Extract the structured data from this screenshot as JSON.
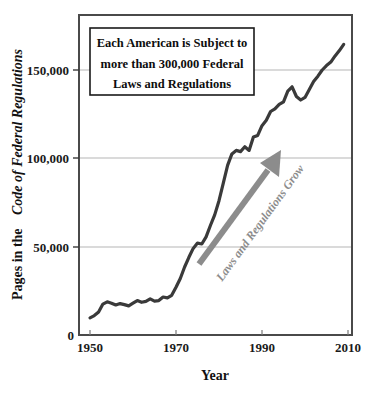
{
  "chart_data": {
    "type": "line",
    "title": "",
    "xlabel": "Year",
    "ylabel_plain": "Pages in the ",
    "ylabel_italic": "Code of Federal Regulations",
    "xlim": [
      1950,
      2013
    ],
    "ylim": [
      0,
      175000
    ],
    "grid": true,
    "legend_position": "none",
    "xticks": [
      "1950",
      "1970",
      "1990",
      "2010"
    ],
    "xtick_values": [
      1950,
      1970,
      1990,
      2010
    ],
    "yticks": [
      "0",
      "50,000",
      "100,000",
      "150,000"
    ],
    "ytick_values": [
      0,
      50000,
      100000,
      150000
    ],
    "series": [
      {
        "name": "Pages in the Code of Federal Regulations",
        "color": "#3a3a3a",
        "x": [
          1950,
          1951,
          1952,
          1953,
          1954,
          1955,
          1956,
          1957,
          1958,
          1959,
          1960,
          1961,
          1962,
          1963,
          1964,
          1965,
          1966,
          1967,
          1968,
          1969,
          1970,
          1971,
          1972,
          1973,
          1974,
          1975,
          1976,
          1977,
          1978,
          1979,
          1980,
          1981,
          1982,
          1983,
          1984,
          1985,
          1986,
          1987,
          1988,
          1989,
          1990,
          1991,
          1992,
          1993,
          1994,
          1995,
          1996,
          1997,
          1998,
          1999,
          2000,
          2001,
          2002,
          2003,
          2004,
          2005,
          2006,
          2007,
          2008,
          2009
        ],
        "values": [
          9745,
          11000,
          13000,
          17500,
          18800,
          18000,
          17000,
          17800,
          17200,
          16500,
          18000,
          19500,
          18500,
          19000,
          20500,
          19200,
          19500,
          21500,
          21000,
          22500,
          27000,
          32000,
          38500,
          44000,
          49000,
          52000,
          51500,
          55500,
          62000,
          68000,
          76000,
          86000,
          96000,
          102500,
          104500,
          103800,
          106500,
          104500,
          112000,
          113000,
          118500,
          121500,
          126500,
          128000,
          130500,
          132000,
          138000,
          140500,
          135000,
          133000,
          134500,
          139000,
          143500,
          146500,
          150000,
          152500,
          154500,
          158000,
          161000,
          164500
        ]
      }
    ],
    "callout": {
      "lines": [
        "Each American is Subject to",
        "more than 300,000 Federal",
        "Laws and Regulations"
      ]
    },
    "annotation_arrow": {
      "label": "Laws and Regulations Grow",
      "color": "#8c8c8c"
    },
    "colors": {
      "line": "#3a3a3a",
      "arrow": "#8c8c8c",
      "grid": "#b5b5b5",
      "frame": "#4a4a4a",
      "text": "#111111",
      "background": "#ffffff"
    }
  }
}
